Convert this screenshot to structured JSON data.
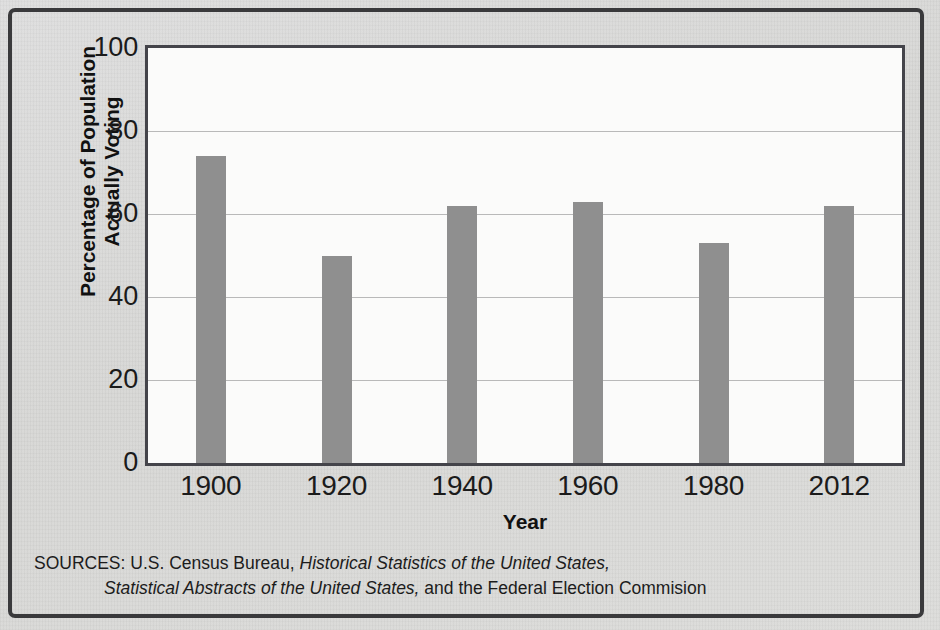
{
  "chart_data": {
    "type": "bar",
    "title": "",
    "xlabel": "Year",
    "ylabel": "Percentage of Population Actually Voting",
    "categories": [
      "1900",
      "1920",
      "1940",
      "1960",
      "1980",
      "2012"
    ],
    "values": [
      74,
      50,
      62,
      63,
      53,
      62
    ],
    "ylim": [
      0,
      100
    ],
    "yticks": [
      "0",
      "20",
      "40",
      "60",
      "80",
      "100"
    ],
    "ytick_values": [
      0,
      20,
      40,
      60,
      80,
      100
    ],
    "grid": true,
    "legend": "none",
    "bar_color": "#8f8f8f",
    "plot_background": "#fbfbfa",
    "figure_background": "#d9d9d7",
    "frame_color": "#3a3a3c",
    "gridline_color": "#b9b9b9"
  },
  "axes": {
    "y_title_line1": "Percentage of Population",
    "y_title_line2": "Actually Voting",
    "x_title": "Year"
  },
  "source": {
    "label": "SOURCES:",
    "line1_plain": " U.S. Census Bureau, ",
    "line1_italic": "Historical Statistics of the United States,",
    "line2_italic": "Statistical Abstracts of the United States,",
    "line2_plain": " and the Federal Election Commision"
  }
}
